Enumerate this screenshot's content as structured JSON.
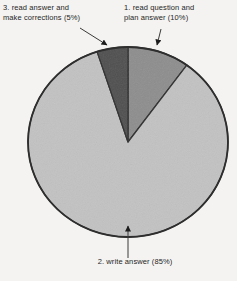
{
  "chart_data": {
    "type": "pie",
    "title": "",
    "slices": [
      {
        "name": "read question and plan answer",
        "percent": 10,
        "color": "#8d8d8d"
      },
      {
        "name": "write answer",
        "percent": 85,
        "color": "#c2c2c2"
      },
      {
        "name": "read answer and make corrections",
        "percent": 5,
        "color": "#4f4f4f"
      }
    ],
    "start_angle_deg": -90,
    "direction": "clockwise",
    "outline_color": "#2e2e2e",
    "legend": "none",
    "labels_position": "outside-callouts"
  },
  "labels": {
    "slice1": {
      "line1": "1. read question and",
      "line2": "plan answer (10%)"
    },
    "slice2": {
      "text": "2. write answer (85%)"
    },
    "slice3": {
      "line1": "3. read answer and",
      "line2": "make corrections (5%)"
    }
  },
  "colors": {
    "background": "#f4f3f1",
    "text": "#1f1f1f",
    "arrow": "#3a3a3a"
  }
}
